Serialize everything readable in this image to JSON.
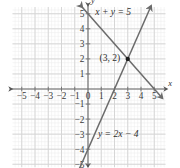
{
  "chart_data": {
    "type": "line",
    "title": "",
    "xlabel": "x",
    "ylabel": "y",
    "xlim": [
      -5,
      5
    ],
    "ylim": [
      -5,
      5
    ],
    "grid": true,
    "grid_color": "#d9d9d9",
    "minor_grid": true,
    "minor_grid_color": "#ececec",
    "axis_color": "#6e6e6e",
    "line_color": "#6b6b6b",
    "xticks": [
      -5,
      -4,
      -3,
      -2,
      -1,
      0,
      1,
      2,
      3,
      4,
      5
    ],
    "xtick_labels": [
      "−5",
      "−4",
      "−3",
      "−2",
      "−1",
      "0",
      "1",
      "2",
      "3",
      "4",
      "5"
    ],
    "yticks": [
      -5,
      -4,
      -3,
      -2,
      -1,
      1,
      2,
      3,
      4,
      5
    ],
    "ytick_labels": [
      "−5",
      "−4",
      "−3",
      "−2",
      "−1",
      "1",
      "2",
      "3",
      "4",
      "5"
    ],
    "series": [
      {
        "name": "x + y = 5",
        "label": "x + y = 5",
        "equation_text": "x + y = 5",
        "slope": -1,
        "intercept": 5,
        "points": [
          [
            -0.45,
            5.45
          ],
          [
            5.6,
            -0.6
          ]
        ],
        "arrows": "both"
      },
      {
        "name": "y = 2x - 4",
        "label": "y = 2x − 4",
        "equation_text": "y = 2x − 4",
        "slope": 2,
        "intercept": -4,
        "points": [
          [
            -0.65,
            -5.3
          ],
          [
            4.75,
            5.5
          ]
        ],
        "arrows": "both"
      }
    ],
    "annotations": [
      {
        "name": "intersection-point",
        "text": "(3, 2)",
        "x": 3,
        "y": 2,
        "marker": "filled-circle"
      }
    ]
  },
  "labels": {
    "x_axis": "x",
    "y_axis": "y",
    "eq_top": "x + y = 5",
    "eq_bottom": "y = 2x − 4",
    "point": "(3, 2)"
  }
}
